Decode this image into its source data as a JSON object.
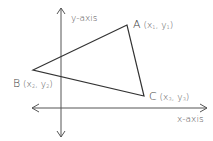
{
  "diagram": {
    "axes": {
      "x_label": "x-axis",
      "y_label": "y-axis"
    },
    "vertices": [
      {
        "name": "A",
        "x_var": "x",
        "x_sub": "1",
        "y_var": "y",
        "y_sub": "1"
      },
      {
        "name": "B",
        "x_var": "x",
        "x_sub": "2",
        "y_var": "y",
        "y_sub": "2"
      },
      {
        "name": "C",
        "x_var": "x",
        "x_sub": "3",
        "y_var": "y",
        "y_sub": "3"
      }
    ],
    "colors": {
      "line": "#333333",
      "axis": "#555555",
      "text": "#555555",
      "background": "#ffffff"
    }
  }
}
